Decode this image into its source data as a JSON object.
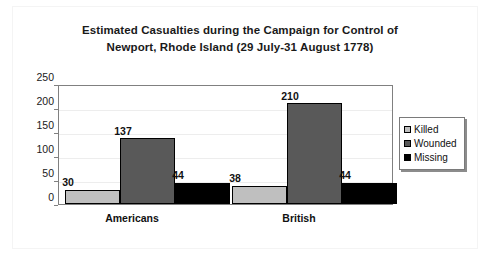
{
  "chart_data": {
    "type": "bar",
    "title": "Estimated Casualties during the Campaign for Control of Newport, Rhode Island (29 July-31 August 1778)",
    "title_line1": "Estimated Casualties during the Campaign for Control of",
    "title_line2": "Newport, Rhode Island (29 July-31 August 1778)",
    "xlabel": "",
    "ylabel": "",
    "categories": [
      "Americans",
      "British"
    ],
    "series": [
      {
        "name": "Killed",
        "values": [
          30,
          38
        ],
        "color": "#bfbfbf"
      },
      {
        "name": "Wounded",
        "values": [
          137,
          210
        ],
        "color": "#595959"
      },
      {
        "name": "Missing",
        "values": [
          44,
          44
        ],
        "color": "#000000"
      }
    ],
    "ylim": [
      0,
      250
    ],
    "yticks": [
      0,
      50,
      100,
      150,
      200,
      250
    ],
    "ytick_labels": [
      "0",
      "50",
      "100",
      "150",
      "200",
      "250"
    ],
    "grid": true,
    "grid_axis": "y",
    "legend_position": "right",
    "data_labels": [
      "30",
      "137",
      "44",
      "38",
      "210",
      "44"
    ]
  },
  "legend": {
    "items": [
      {
        "label": "Killed",
        "swatch": "killed"
      },
      {
        "label": "Wounded",
        "swatch": "wounded"
      },
      {
        "label": "Missing",
        "swatch": "missing"
      }
    ]
  }
}
